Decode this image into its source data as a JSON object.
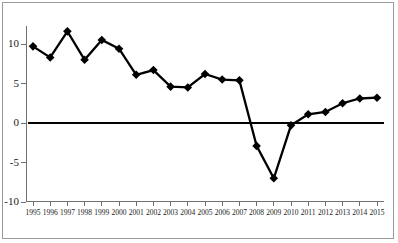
{
  "chart_data": {
    "type": "line",
    "title": "",
    "subtitle": "",
    "xlabel": "",
    "ylabel": "",
    "categories": [
      "1995",
      "1996",
      "1997",
      "1998",
      "1999",
      "2000",
      "2001",
      "2002",
      "2003",
      "2004",
      "2005",
      "2006",
      "2007",
      "2008",
      "2009",
      "2010",
      "2011",
      "2012",
      "2013",
      "2014",
      "2015"
    ],
    "values": [
      9.7,
      8.3,
      11.6,
      8.0,
      10.5,
      9.4,
      6.1,
      6.7,
      4.6,
      4.5,
      6.2,
      5.5,
      5.4,
      -2.9,
      -7.0,
      -0.3,
      1.1,
      1.4,
      2.5,
      3.1,
      3.2
    ],
    "series": [
      {
        "name": "series-1",
        "values": [
          9.7,
          8.3,
          11.6,
          8.0,
          10.5,
          9.4,
          6.1,
          6.7,
          4.6,
          4.5,
          6.2,
          5.5,
          5.4,
          -2.9,
          -7.0,
          -0.3,
          1.1,
          1.4,
          2.5,
          3.1,
          3.2
        ]
      }
    ],
    "ylim": [
      -10,
      12.5
    ],
    "xlim": [
      "1995",
      "2015"
    ],
    "yticks": [
      10,
      5,
      0,
      -5,
      -10
    ],
    "ytick_labels": [
      "10",
      "5",
      "0",
      "-5",
      "-10"
    ],
    "xtick_labels": [
      "1995",
      "1996",
      "1997",
      "1998",
      "1999",
      "2000",
      "2001",
      "2002",
      "2003",
      "2004",
      "2005",
      "2006",
      "2007",
      "2008",
      "2009",
      "2010",
      "2011",
      "2012",
      "2013",
      "2014",
      "2015"
    ],
    "grid": false,
    "legend": null,
    "legend_position": "none",
    "marker": "diamond",
    "annotations": [],
    "colors": {
      "series": "#000000",
      "axis": "#6f6f6f",
      "zero_line": "#000000",
      "frame": "#9a9a9a",
      "background": "#ffffff",
      "text": "#1a1a1a"
    }
  }
}
